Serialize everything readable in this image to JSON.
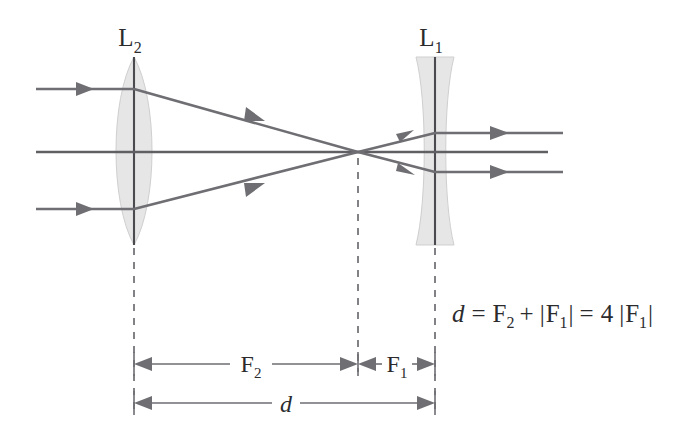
{
  "diagram": {
    "background_color": "#ffffff",
    "stroke_color": "#6e6e73",
    "lens_fill_color": "#e6e6e6",
    "text_color": "#2b2b2e",
    "labels": {
      "lens_left_main": "L",
      "lens_left_sub": "2",
      "lens_right_main": "L",
      "lens_right_sub": "1"
    },
    "dimensions": {
      "f2_main": "F",
      "f2_sub": "2",
      "f1_main": "F",
      "f1_sub": "1",
      "d_label": "d"
    },
    "equation": {
      "d": "d",
      "eq1": "=",
      "F": "F",
      "sub2": "2",
      "plus": "+",
      "bar_open": "|",
      "F1": "F",
      "sub1": "1",
      "bar_close": "|",
      "eq2": "=",
      "four": "4",
      "bar_open2": "|",
      "F1b": "F",
      "sub1b": "1",
      "bar_close2": "|",
      "full_text": "d = F2 + |F1| = 4 |F1|"
    },
    "geometry": {
      "optical_axis_y": 152,
      "lens_left_x": 134,
      "lens_right_x": 435,
      "focus_x": 358,
      "lens_top_y": 57,
      "lens_bottom_y": 245,
      "input_ray_start_x": 36,
      "input_ray_top_y": 89,
      "input_ray_bottom_y": 209,
      "output_ray_top_y": 133,
      "output_ray_bottom_y": 172,
      "output_ray_end_x": 563,
      "dim_f_line_y": 364,
      "dim_d_line_y": 403
    }
  }
}
